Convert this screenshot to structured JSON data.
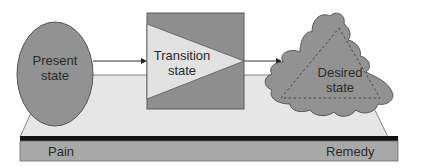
{
  "nodes": {
    "present": {
      "line1": "Present",
      "line2": "state"
    },
    "transition": {
      "line1": "Transition",
      "line2": "state"
    },
    "desired": {
      "line1": "Desired",
      "line2": "state"
    }
  },
  "platform": {
    "left_label": "Pain",
    "right_label": "Remedy"
  },
  "colors": {
    "dark_gray": "#8e8e8e",
    "mid_gray": "#a6a6a6",
    "light_gray": "#e2e2e2",
    "platform_top": "#e6e6e6",
    "bar": "#111111",
    "outline": "#5a5a5a"
  }
}
